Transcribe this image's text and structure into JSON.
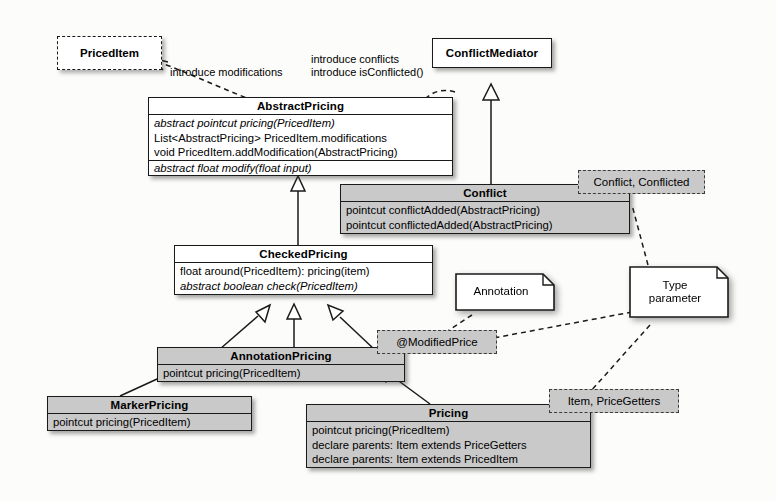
{
  "diagram": {
    "type": "uml-class-diagram",
    "classes": [
      {
        "id": "abstract-pricing",
        "name": "AbstractPricing",
        "shaded": false,
        "members": [
          {
            "text": "abstract pointcut pricing(PricedItem)",
            "italic": true,
            "separator_above": false
          },
          {
            "text": "List<AbstractPricing> PricedItem.modifications",
            "italic": false,
            "separator_above": false
          },
          {
            "text": "void PricedItem.addModification(AbstractPricing)",
            "italic": false,
            "separator_above": false
          },
          {
            "text": "abstract float modify(float input)",
            "italic": true,
            "separator_above": true
          }
        ]
      },
      {
        "id": "conflict",
        "name": "Conflict",
        "shaded": true,
        "members": [
          {
            "text": "pointcut conflictAdded(AbstractPricing)",
            "italic": false,
            "separator_above": false
          },
          {
            "text": "pointcut conflictedAdded(AbstractPricing)",
            "italic": false,
            "separator_above": false
          }
        ]
      },
      {
        "id": "checked-pricing",
        "name": "CheckedPricing",
        "shaded": false,
        "members": [
          {
            "text": "float around(PricedItem): pricing(item)",
            "italic": false,
            "separator_above": false
          },
          {
            "text": "abstract boolean check(PricedItem)",
            "italic": true,
            "separator_above": false
          }
        ]
      },
      {
        "id": "annotation-pricing",
        "name": "AnnotationPricing",
        "shaded": true,
        "members": [
          {
            "text": "pointcut pricing(PricedItem)",
            "italic": false,
            "separator_above": false
          }
        ]
      },
      {
        "id": "marker-pricing",
        "name": "MarkerPricing",
        "shaded": true,
        "members": [
          {
            "text": "pointcut pricing(PricedItem)",
            "italic": false,
            "separator_above": false
          }
        ]
      },
      {
        "id": "pricing",
        "name": "Pricing",
        "shaded": true,
        "members": [
          {
            "text": "pointcut pricing(PricedItem)",
            "italic": false,
            "separator_above": false
          },
          {
            "text": "declare parents: Item extends PriceGetters",
            "italic": false,
            "separator_above": false
          },
          {
            "text": "declare parents: Item extends PricedItem",
            "italic": false,
            "separator_above": false
          }
        ]
      },
      {
        "id": "conflict-mediator",
        "name": "ConflictMediator",
        "shaded": false,
        "members": []
      }
    ],
    "dashed_classes": [
      {
        "id": "priced-item",
        "name": "PricedItem"
      }
    ],
    "tags": [
      {
        "id": "tag-conflict",
        "label": "Conflict, Conflicted"
      },
      {
        "id": "tag-modified-price",
        "label": "@ModifiedPrice"
      },
      {
        "id": "tag-item-pricegetters",
        "label": "Item, PriceGetters"
      }
    ],
    "notes": [
      {
        "id": "note-annotation",
        "label": "Annotation"
      },
      {
        "id": "note-type-parameter",
        "label": "Type\nparameter",
        "line1": "Type",
        "line2": "parameter"
      }
    ],
    "edge_labels": [
      {
        "id": "label-introduce-modifications",
        "text": "introduce modifications"
      },
      {
        "id": "label-introduce-conflicts-1",
        "text": "introduce conflicts"
      },
      {
        "id": "label-introduce-conflicts-2",
        "text": "introduce isConflicted()"
      }
    ],
    "relationships": [
      {
        "from": "checked-pricing",
        "to": "abstract-pricing",
        "kind": "generalization"
      },
      {
        "from": "conflict",
        "to": "conflict-mediator",
        "kind": "generalization"
      },
      {
        "from": "annotation-pricing",
        "to": "checked-pricing",
        "kind": "generalization"
      },
      {
        "from": "marker-pricing",
        "to": "annotation-pricing",
        "kind": "generalization"
      },
      {
        "from": "pricing",
        "to": "annotation-pricing",
        "kind": "generalization"
      },
      {
        "from": "abstract-pricing",
        "to": "priced-item",
        "kind": "introduction",
        "label": "introduce modifications"
      },
      {
        "from": "abstract-pricing",
        "to": "tag-conflict",
        "kind": "introduction",
        "label": "introduce conflicts / introduce isConflicted()"
      },
      {
        "from": "note-annotation",
        "to": "tag-modified-price",
        "kind": "note-anchor"
      },
      {
        "from": "note-type-parameter",
        "to": "tag-modified-price",
        "kind": "note-anchor"
      },
      {
        "from": "note-type-parameter",
        "to": "tag-item-pricegetters",
        "kind": "note-anchor"
      },
      {
        "from": "note-type-parameter",
        "to": "tag-conflict",
        "kind": "note-anchor"
      }
    ],
    "colors": {
      "shaded_fill": "#c9c9c9",
      "plain_fill": "#ffffff",
      "stroke": "#1a1a1a",
      "background": "#fcfcfa"
    }
  }
}
